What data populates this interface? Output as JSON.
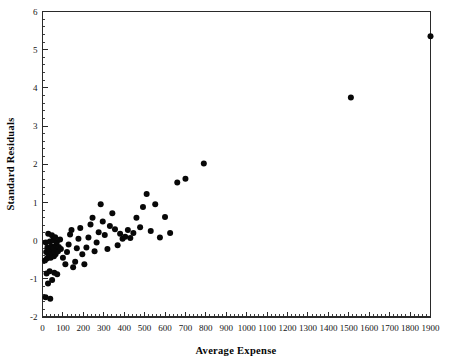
{
  "chart_data": {
    "type": "scatter",
    "title": "",
    "xlabel": "Average Expense",
    "ylabel": "Standard Residuals",
    "xlim": [
      0,
      1900
    ],
    "ylim": [
      -2,
      6
    ],
    "xticks": [
      0,
      100,
      200,
      300,
      400,
      500,
      600,
      700,
      800,
      900,
      1000,
      1100,
      1200,
      1300,
      1400,
      1500,
      1600,
      1700,
      1800,
      1900
    ],
    "yticks": [
      -2,
      -1,
      0,
      1,
      2,
      3,
      4,
      5,
      6
    ],
    "xtick_labels": [
      "0",
      "100",
      "200",
      "300",
      "400",
      "500",
      "600",
      "700",
      "800",
      "900",
      "1000",
      "1100",
      "1200",
      "1300",
      "1400",
      "1500",
      "1600",
      "1700",
      "1800",
      "1900"
    ],
    "ytick_labels": [
      "-2",
      "-1",
      "0",
      "1",
      "2",
      "3",
      "4",
      "5",
      "6"
    ],
    "minor_ticks_per_interval": 5,
    "grid": false,
    "legend": null,
    "marker": "filled-circle",
    "marker_color": "#080808",
    "marker_size_px": 3.0,
    "n_points": 86,
    "points": [
      [
        15,
        -1.48
      ],
      [
        38,
        -1.52
      ],
      [
        27,
        -1.12
      ],
      [
        47,
        -1.03
      ],
      [
        20,
        -0.86
      ],
      [
        35,
        -0.8
      ],
      [
        58,
        -0.84
      ],
      [
        72,
        -0.88
      ],
      [
        12,
        -0.52
      ],
      [
        22,
        -0.47
      ],
      [
        30,
        -0.42
      ],
      [
        40,
        -0.45
      ],
      [
        48,
        -0.38
      ],
      [
        56,
        -0.41
      ],
      [
        64,
        -0.36
      ],
      [
        18,
        -0.3
      ],
      [
        26,
        -0.33
      ],
      [
        34,
        -0.28
      ],
      [
        42,
        -0.31
      ],
      [
        50,
        -0.26
      ],
      [
        60,
        -0.3
      ],
      [
        68,
        -0.24
      ],
      [
        76,
        -0.28
      ],
      [
        24,
        -0.18
      ],
      [
        32,
        -0.21
      ],
      [
        44,
        -0.15
      ],
      [
        54,
        -0.19
      ],
      [
        66,
        -0.13
      ],
      [
        80,
        -0.17
      ],
      [
        90,
        -0.22
      ],
      [
        16,
        -0.05
      ],
      [
        36,
        -0.02
      ],
      [
        52,
        0.01
      ],
      [
        70,
        -0.04
      ],
      [
        86,
        0.03
      ],
      [
        28,
        0.18
      ],
      [
        46,
        0.14
      ],
      [
        62,
        0.09
      ],
      [
        100,
        -0.45
      ],
      [
        112,
        -0.62
      ],
      [
        120,
        -0.3
      ],
      [
        128,
        -0.1
      ],
      [
        135,
        0.16
      ],
      [
        142,
        0.28
      ],
      [
        150,
        -0.7
      ],
      [
        160,
        -0.55
      ],
      [
        168,
        -0.2
      ],
      [
        176,
        0.05
      ],
      [
        185,
        0.33
      ],
      [
        195,
        -0.36
      ],
      [
        205,
        -0.62
      ],
      [
        215,
        -0.18
      ],
      [
        225,
        0.08
      ],
      [
        235,
        0.42
      ],
      [
        245,
        0.6
      ],
      [
        255,
        -0.28
      ],
      [
        265,
        -0.05
      ],
      [
        275,
        0.22
      ],
      [
        285,
        0.95
      ],
      [
        295,
        0.5
      ],
      [
        305,
        0.15
      ],
      [
        318,
        -0.22
      ],
      [
        330,
        0.38
      ],
      [
        342,
        0.72
      ],
      [
        355,
        0.3
      ],
      [
        368,
        -0.12
      ],
      [
        380,
        0.18
      ],
      [
        392,
        0.05
      ],
      [
        405,
        0.1
      ],
      [
        418,
        0.28
      ],
      [
        430,
        0.07
      ],
      [
        445,
        0.2
      ],
      [
        460,
        0.6
      ],
      [
        478,
        0.35
      ],
      [
        492,
        0.88
      ],
      [
        510,
        1.22
      ],
      [
        530,
        0.25
      ],
      [
        552,
        0.95
      ],
      [
        575,
        0.08
      ],
      [
        600,
        0.62
      ],
      [
        625,
        0.2
      ],
      [
        660,
        1.52
      ],
      [
        700,
        1.62
      ],
      [
        790,
        2.02
      ],
      [
        1510,
        3.75
      ],
      [
        1900,
        5.35
      ]
    ]
  },
  "axes": {
    "x_axis_title": "Average Expense",
    "y_axis_title": "Standard Residuals"
  }
}
